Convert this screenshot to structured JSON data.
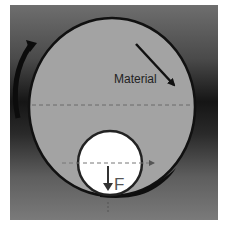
{
  "diagram": {
    "title": "",
    "labels": {
      "material": "Material",
      "force": "F"
    },
    "colors": {
      "page_background": "#ffffff",
      "frame_light": "#7a7a7a",
      "frame_dark": "#151515",
      "large_roll_fill": "#a3a3a3",
      "small_roll_fill": "#ffffff",
      "outline": "#111111",
      "dashed_line": "#666666",
      "material_strip": "#111111"
    },
    "elements": {
      "large_roll": {
        "cx": 112,
        "cy": 107,
        "rx": 83,
        "ry": 89
      },
      "small_roll": {
        "cx": 110,
        "cy": 163,
        "r": 32
      },
      "material_arrow": {
        "x1": 136,
        "y1": 44,
        "x2": 176,
        "y2": 87
      },
      "rotation_arrow": {
        "direction": "counter-clockwise",
        "side": "left"
      },
      "force_arrow": {
        "x": 108,
        "y1": 166,
        "y2": 189
      }
    }
  }
}
